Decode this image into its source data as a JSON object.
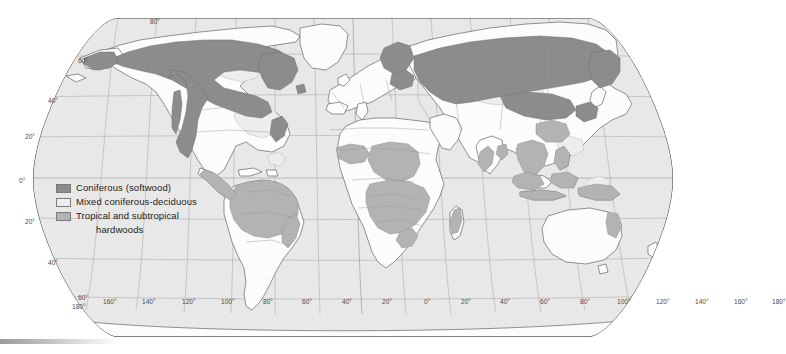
{
  "map": {
    "title": "World distribution of forest types",
    "projection": "Robinson",
    "ocean_color": "#e8e8e8",
    "land_color": "#fcfcfc",
    "border_color": "#8a8a8a",
    "coast_color": "#4d4d4d",
    "graticule_color": "#b0b0b0"
  },
  "legend": {
    "items": [
      {
        "label": "Coniferous (softwood)",
        "color": "#8c8c8c",
        "swatch_name": "coniferous-swatch"
      },
      {
        "label": "Mixed coniferous-deciduous",
        "color": "#ededed",
        "swatch_name": "mixed-swatch"
      },
      {
        "label": "Tropical and subtropical",
        "label_line2": "hardwoods",
        "color": "#b3b3b3",
        "swatch_name": "tropical-swatch"
      }
    ]
  },
  "graticule": {
    "latitude_labels": [
      {
        "text": "80°",
        "x": 150,
        "y": 18
      },
      {
        "text": "60°",
        "x": 78,
        "y": 57
      },
      {
        "text": "40°",
        "x": 48,
        "y": 97
      },
      {
        "text": "20°",
        "x": 25,
        "y": 133
      },
      {
        "text": "0°",
        "x": 19,
        "y": 177
      },
      {
        "text": "20°",
        "x": 25,
        "y": 218
      },
      {
        "text": "40°",
        "x": 48,
        "y": 259
      },
      {
        "text": "60°",
        "x": 78,
        "y": 294
      }
    ],
    "longitude_labels": [
      {
        "text": "180°",
        "x": 72,
        "y": 303
      },
      {
        "text": "160°",
        "x": 103,
        "y": 298
      },
      {
        "text": "140°",
        "x": 142,
        "y": 298
      },
      {
        "text": "120°",
        "x": 182,
        "y": 298
      },
      {
        "text": "100°",
        "x": 221,
        "y": 298
      },
      {
        "text": "80°",
        "x": 263,
        "y": 298
      },
      {
        "text": "60°",
        "x": 302,
        "y": 298
      },
      {
        "text": "40°",
        "x": 342,
        "y": 298
      },
      {
        "text": "20°",
        "x": 382,
        "y": 298
      },
      {
        "text": "0°",
        "x": 424,
        "y": 298
      },
      {
        "text": "20°",
        "x": 461,
        "y": 298
      },
      {
        "text": "40°",
        "x": 500,
        "y": 298
      },
      {
        "text": "60°",
        "x": 540,
        "y": 298
      },
      {
        "text": "80°",
        "x": 580,
        "y": 298
      },
      {
        "text": "100°",
        "x": 617,
        "y": 298
      },
      {
        "text": "120°",
        "x": 656,
        "y": 298
      },
      {
        "text": "140°",
        "x": 695,
        "y": 298
      },
      {
        "text": "160°",
        "x": 734,
        "y": 298
      },
      {
        "text": "180°",
        "x": 772,
        "y": 298
      }
    ]
  }
}
